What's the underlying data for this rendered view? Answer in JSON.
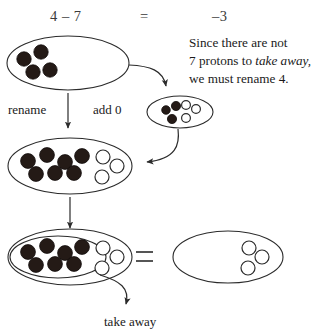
{
  "equation": {
    "left": "4 – 7",
    "equals": "=",
    "right": "–3"
  },
  "note": {
    "line1": "Since there are not",
    "line2_pre": "7 protons to ",
    "line2_italic": "take away,",
    "line3": "we must rename 4."
  },
  "labels": {
    "rename": "rename",
    "add_zero": "add 0",
    "take_away": "take away",
    "bottom_equals": "="
  },
  "groups": {
    "start_oval": {
      "name": "four-protons",
      "filled_count": 4,
      "open_count": 0,
      "filled": [
        {
          "x": 24,
          "y": 59
        },
        {
          "x": 41,
          "y": 52
        },
        {
          "x": 33,
          "y": 72
        },
        {
          "x": 50,
          "y": 70
        }
      ],
      "open": []
    },
    "zero_pair_oval": {
      "name": "add-zero-pair",
      "filled_count": 3,
      "open_count": 3,
      "filled": [
        {
          "x": 166,
          "y": 110
        },
        {
          "x": 175,
          "y": 106
        },
        {
          "x": 172,
          "y": 118
        }
      ],
      "open": [
        {
          "x": 185,
          "y": 106
        },
        {
          "x": 194,
          "y": 110
        },
        {
          "x": 185,
          "y": 118
        }
      ]
    },
    "renamed_oval": {
      "name": "renamed-ten-group",
      "filled_count": 7,
      "open_count": 3,
      "filled": [
        {
          "x": 28,
          "y": 161
        },
        {
          "x": 47,
          "y": 155
        },
        {
          "x": 65,
          "y": 162
        },
        {
          "x": 82,
          "y": 156
        },
        {
          "x": 36,
          "y": 173
        },
        {
          "x": 55,
          "y": 172
        },
        {
          "x": 74,
          "y": 172
        }
      ],
      "open": [
        {
          "x": 103,
          "y": 157
        },
        {
          "x": 116,
          "y": 165
        },
        {
          "x": 102,
          "y": 176
        }
      ]
    },
    "take_away_oval": {
      "name": "take-away-group",
      "filled_count": 7,
      "open_count": 3,
      "filled": [
        {
          "x": 28,
          "y": 252
        },
        {
          "x": 47,
          "y": 246
        },
        {
          "x": 65,
          "y": 253
        },
        {
          "x": 82,
          "y": 247
        },
        {
          "x": 36,
          "y": 264
        },
        {
          "x": 55,
          "y": 263
        },
        {
          "x": 74,
          "y": 263
        }
      ],
      "open": [
        {
          "x": 103,
          "y": 248
        },
        {
          "x": 116,
          "y": 256
        },
        {
          "x": 102,
          "y": 267
        }
      ]
    },
    "result_oval": {
      "name": "result-three-electrons",
      "filled_count": 0,
      "open_count": 3,
      "filled": [],
      "open": [
        {
          "x": 248,
          "y": 248
        },
        {
          "x": 261,
          "y": 257
        },
        {
          "x": 247,
          "y": 267
        }
      ]
    }
  },
  "colors": {
    "ink": "#2b2b2b",
    "filled_chip": "#241a16",
    "paper": "#ffffff"
  }
}
